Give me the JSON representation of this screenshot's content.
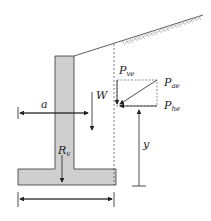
{
  "diagram": {
    "labels": {
      "pve": "P",
      "pve_sub": "ve",
      "pae": "P",
      "pae_sub": "ae",
      "phe": "P",
      "phe_sub": "he",
      "w": "W",
      "a": "a",
      "rv": "R",
      "rv_sub": "v",
      "y": "y"
    },
    "colors": {
      "wall_fill": "#cfcfcf",
      "line": "#222222",
      "hatch": "#888888"
    }
  }
}
